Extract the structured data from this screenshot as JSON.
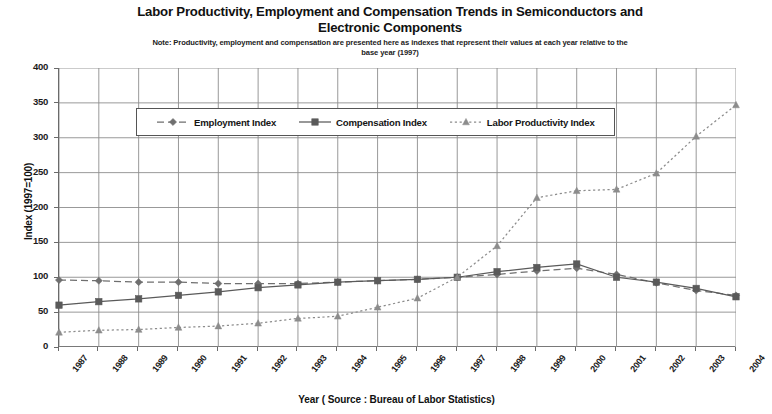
{
  "header": {
    "title_line1": "Labor Productivity, Employment and Compensation Trends in Semiconductors and",
    "title_line2": "Electronic  Components",
    "note_line1": "Note: Productivity, employment and compensation are presented here as indexes that represent their values at each year relative to the",
    "note_line2": "base year (1997)"
  },
  "axes": {
    "ylabel": "Index  (1997=100)",
    "xlabel": "Year ( Source : Bureau of Labor Statistics)",
    "yticks": [
      "400",
      "350",
      "300",
      "250",
      "200",
      "150",
      "100",
      "50",
      "0"
    ],
    "xticks": [
      "1987",
      "1988",
      "1989",
      "1990",
      "1991",
      "1992",
      "1993",
      "1994",
      "1995",
      "1996",
      "1997",
      "1998",
      "1999",
      "2000",
      "2001",
      "2002",
      "2003",
      "2004"
    ]
  },
  "legend": {
    "items": [
      {
        "label": "Employment Index",
        "marker": "diamond",
        "dash": "dash",
        "color": "#6f6f6f"
      },
      {
        "label": "Compensation Index",
        "marker": "square",
        "dash": "solid",
        "color": "#5a5a5a"
      },
      {
        "label": "Labor Productivity Index",
        "marker": "triangle",
        "dash": "dot",
        "color": "#8c8c8c"
      }
    ]
  },
  "colors": {
    "employment": "#6f6f6f",
    "compensation": "#5a5a5a",
    "productivity": "#8c8c8c",
    "grid": "#8d8d8d",
    "axis": "#6a6a6a"
  },
  "chart_data": {
    "type": "line",
    "title": "Labor Productivity, Employment and Compensation Trends in Semiconductors and Electronic Components",
    "subtitle": "Note: Productivity, employment and compensation are presented here as indexes that represent their values at each year relative to the base year (1997)",
    "xlabel": "Year ( Source : Bureau of Labor Statistics)",
    "ylabel": "Index  (1997=100)",
    "grid": true,
    "legend_position": "inside-top-left",
    "x": [
      1987,
      1988,
      1989,
      1990,
      1991,
      1992,
      1993,
      1994,
      1995,
      1996,
      1997,
      1998,
      1999,
      2000,
      2001,
      2002,
      2003,
      2004
    ],
    "xlim": [
      1987,
      2004
    ],
    "ylim": [
      0,
      400
    ],
    "ytick_step": 50,
    "series": [
      {
        "name": "Employment Index",
        "marker": "diamond",
        "dash": "dash",
        "values": [
          96,
          95,
          93,
          93,
          91,
          91,
          91,
          93,
          95,
          97,
          100,
          104,
          109,
          113,
          104,
          92,
          81,
          74
        ]
      },
      {
        "name": "Compensation Index",
        "marker": "square",
        "dash": "solid",
        "values": [
          60,
          65,
          69,
          74,
          79,
          85,
          89,
          93,
          95,
          97,
          100,
          108,
          114,
          119,
          100,
          93,
          84,
          72
        ]
      },
      {
        "name": "Labor Productivity Index",
        "marker": "triangle",
        "dash": "dot",
        "values": [
          21,
          24,
          25,
          28,
          30,
          34,
          41,
          44,
          57,
          70,
          100,
          145,
          214,
          224,
          226,
          249,
          302,
          347
        ]
      }
    ]
  }
}
